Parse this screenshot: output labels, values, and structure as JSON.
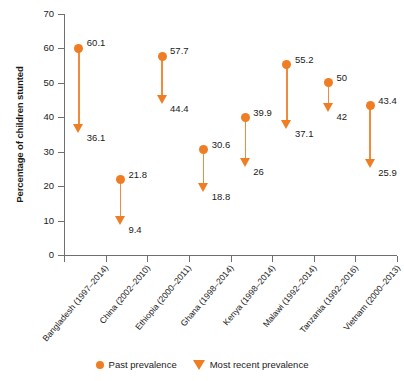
{
  "chart_data": {
    "type": "scatter",
    "title": "",
    "subtitle": "",
    "xlabel": "",
    "ylabel": "Percentage of children stunted",
    "ylim": [
      0,
      70
    ],
    "ytick_labels": [
      "0",
      "10",
      "20",
      "30",
      "40",
      "50",
      "60",
      "70"
    ],
    "ytick_values": [
      0,
      10,
      20,
      30,
      40,
      50,
      60,
      70
    ],
    "grid": false,
    "legend_position": "bottom",
    "categories": [
      "Bangladesh (1997–2014)",
      "China (2002–2010)",
      "Ethiopia (2000–2011)",
      "Ghana (1998–2014)",
      "Kenya (1998–2014)",
      "Malawi (1992–2014)",
      "Tanzania (1992–2016)",
      "Vietnam (2000–2013)"
    ],
    "series": [
      {
        "name": "Past prevalence",
        "marker": "circle",
        "color": "#ef7d24",
        "values": [
          60.1,
          21.8,
          57.7,
          30.6,
          39.9,
          55.2,
          50,
          43.4
        ],
        "value_labels": [
          "60.1",
          "21.8",
          "57.7",
          "30.6",
          "39.9",
          "55.2",
          "50",
          "43.4"
        ]
      },
      {
        "name": "Most recent prevalence",
        "marker": "down-triangle",
        "color": "#ef7d24",
        "values": [
          36.1,
          9.4,
          44.4,
          18.8,
          26,
          37.1,
          42,
          25.9
        ],
        "value_labels": [
          "36.1",
          "9.4",
          "44.4",
          "18.8",
          "26",
          "37.1",
          "42",
          "25.9"
        ]
      }
    ]
  },
  "legend": {
    "items": [
      {
        "label": "Past prevalence",
        "icon": "circle-marker-icon"
      },
      {
        "label": "Most recent prevalence",
        "icon": "down-triangle-marker-icon"
      }
    ]
  }
}
